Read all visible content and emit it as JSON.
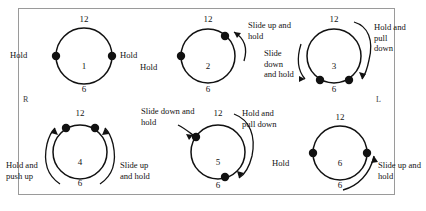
{
  "figure": {
    "type": "clock-face-instruction-diagram",
    "side_markers": {
      "right": "R",
      "left": "L"
    },
    "colors": {
      "frame_border": "#9a9a9a",
      "circle_stroke": "#111111",
      "dot_fill": "#111111",
      "background": "#ffffff",
      "text": "#141414"
    },
    "clock_labels": {
      "top": "12",
      "bottom": "6"
    }
  },
  "units": [
    {
      "number": "1",
      "top": "12",
      "bottom": "6",
      "labels": {
        "left": "Hold",
        "right": "Hold"
      },
      "dots": [
        "9 o'clock",
        "3 o'clock"
      ],
      "arrows": []
    },
    {
      "number": "2",
      "top": "12",
      "bottom": "6",
      "labels": {
        "left": "Hold",
        "upper_right": "Slide up and hold"
      },
      "dots": [
        "1 o'clock",
        "9 o'clock"
      ],
      "arrows": [
        "up-right"
      ]
    },
    {
      "number": "3",
      "top": "12",
      "bottom": "6",
      "labels": {
        "upper_right": "Hold and pull down",
        "left": "Slide down and hold"
      },
      "dots": [
        "7 o'clock",
        "5 o'clock"
      ],
      "arrows": [
        "down-left",
        "down-right"
      ]
    },
    {
      "number": "4",
      "top": "12",
      "bottom": "6",
      "labels": {
        "lower_left": "Hold and push up",
        "lower_right": "Slide up and hold"
      },
      "dots": [
        "11 o'clock",
        "1 o'clock"
      ],
      "arrows": [
        "up-left",
        "up-right"
      ]
    },
    {
      "number": "5",
      "top": "12",
      "bottom": "6",
      "labels": {
        "upper_left": "Slide down and hold",
        "upper_right": "Hold and pull down"
      },
      "dots": [
        "10 o'clock",
        "5 o'clock"
      ],
      "arrows": [
        "down-left",
        "down-right"
      ]
    },
    {
      "number": "6",
      "top": "12",
      "bottom": "6",
      "labels": {
        "left": "Hold",
        "lower_right": "Slide up and hold"
      },
      "dots": [
        "9 o'clock",
        "3 o'clock"
      ],
      "arrows": [
        "up-right"
      ]
    }
  ]
}
